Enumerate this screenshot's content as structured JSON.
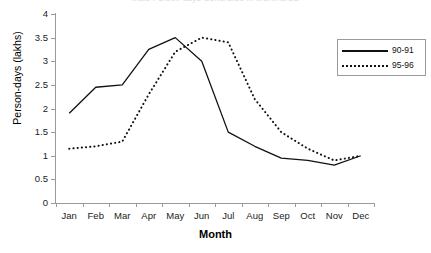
{
  "chart_data": {
    "type": "line",
    "title": "Male Person-days Generated in MGNREGS",
    "xlabel": "Month",
    "ylabel": "Person-days (lakhs)",
    "categories": [
      "Jan",
      "Feb",
      "Mar",
      "Apr",
      "May",
      "Jun",
      "Jul",
      "Aug",
      "Sep",
      "Oct",
      "Nov",
      "Dec"
    ],
    "ylim": [
      0,
      4
    ],
    "yticks": [
      "0",
      "0.5",
      "1",
      "1.5",
      "2",
      "2.5",
      "3",
      "3.5",
      "4"
    ],
    "grid": false,
    "legend_position": "top-right",
    "series": [
      {
        "name": "90-91",
        "style": "solid",
        "color": "#111111",
        "values": [
          1.9,
          2.45,
          2.5,
          3.25,
          3.5,
          3.0,
          1.5,
          1.2,
          0.95,
          0.9,
          0.8,
          1.0
        ]
      },
      {
        "name": "95-96",
        "style": "dotted",
        "color": "#111111",
        "values": [
          1.15,
          1.2,
          1.3,
          2.3,
          3.2,
          3.5,
          3.4,
          2.2,
          1.5,
          1.15,
          0.9,
          1.0
        ]
      }
    ]
  },
  "legend": {
    "entries": [
      {
        "label": "90-91"
      },
      {
        "label": "95-96"
      }
    ]
  }
}
